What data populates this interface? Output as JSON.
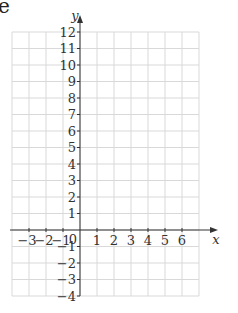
{
  "fragment_text": "e",
  "chart_data": {
    "type": "scatter",
    "title": "",
    "xlabel": "x",
    "ylabel": "y",
    "xlim": [
      -4,
      7
    ],
    "ylim": [
      -4,
      12
    ],
    "x_ticks": [
      -3,
      -2,
      -1,
      1,
      2,
      3,
      4,
      5,
      6
    ],
    "y_ticks": [
      -4,
      -3,
      -2,
      -1,
      1,
      2,
      3,
      4,
      5,
      6,
      7,
      8,
      9,
      10,
      11,
      12
    ],
    "origin_label": "0",
    "grid": true,
    "points": [],
    "series": []
  },
  "colors": {
    "grid": "#d9d9d9",
    "axis": "#333333",
    "text": "#333333"
  }
}
